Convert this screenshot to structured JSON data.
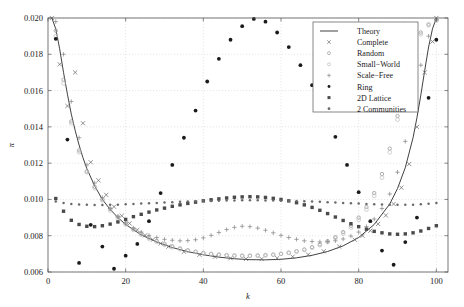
{
  "figure": {
    "background": "#ffffff",
    "frame_color": "#555555",
    "grid": true
  },
  "chart_data": {
    "type": "scatter",
    "title": "",
    "xlabel": "k",
    "ylabel": "π",
    "xlim": [
      0,
      103
    ],
    "ylim": [
      0.006,
      0.02
    ],
    "xticks": [
      0,
      20,
      40,
      60,
      80,
      100
    ],
    "xtick_labels": [
      "0",
      "20",
      "40",
      "60",
      "80",
      "100"
    ],
    "yticks": [
      0.006,
      0.008,
      0.01,
      0.012,
      0.014,
      0.016,
      0.018,
      0.02
    ],
    "ytick_labels": [
      "0.006",
      "0.008",
      "0.010",
      "0.012",
      "0.014",
      "0.016",
      "0.018",
      "0.020"
    ],
    "grid": true,
    "legend_position": "top-right",
    "series": [
      {
        "name": "Theory",
        "marker": "line",
        "color": "#2b2b2b",
        "x": [
          1,
          2,
          3,
          4,
          5,
          6,
          7,
          8,
          9,
          10,
          12,
          14,
          16,
          18,
          20,
          24,
          28,
          32,
          36,
          40,
          44,
          48,
          52,
          56,
          60,
          64,
          68,
          72,
          76,
          80,
          84,
          88,
          90,
          92,
          94,
          95,
          96,
          97,
          98,
          99,
          100
        ],
        "y": [
          0.02,
          0.0194,
          0.0183,
          0.017,
          0.0158,
          0.0147,
          0.0138,
          0.013,
          0.0123,
          0.0117,
          0.01075,
          0.01,
          0.00945,
          0.009,
          0.00862,
          0.00805,
          0.00765,
          0.00735,
          0.00712,
          0.00695,
          0.00682,
          0.00673,
          0.00668,
          0.00667,
          0.0067,
          0.00678,
          0.00692,
          0.00713,
          0.00744,
          0.0079,
          0.00862,
          0.00975,
          0.0106,
          0.01175,
          0.0134,
          0.0145,
          0.01575,
          0.0171,
          0.0184,
          0.0194,
          0.02
        ]
      },
      {
        "name": "Complete",
        "marker": "cross",
        "color": "#6e6e6e",
        "x": [
          1,
          3,
          5,
          7,
          9,
          11,
          13,
          15,
          17,
          19,
          21,
          23,
          25,
          27,
          29,
          31,
          35,
          39,
          43,
          47,
          51,
          55,
          59,
          63,
          67,
          71,
          75,
          79,
          81,
          83,
          85,
          87,
          89,
          91,
          93,
          95,
          97,
          99,
          100
        ],
        "y": [
          0.02,
          0.01745,
          0.01515,
          0.017,
          0.0142,
          0.01205,
          0.01105,
          0.01025,
          0.0096,
          0.0091,
          0.00868,
          0.00832,
          0.00802,
          0.00778,
          0.00757,
          0.0074,
          0.00712,
          0.00695,
          0.00684,
          0.00676,
          0.00672,
          0.00672,
          0.00676,
          0.00684,
          0.00696,
          0.00714,
          0.0074,
          0.00778,
          0.008,
          0.00828,
          0.00865,
          0.00912,
          0.00975,
          0.01065,
          0.01195,
          0.014,
          0.017,
          0.0187,
          0.02
        ]
      },
      {
        "name": "Random",
        "marker": "circle",
        "color": "#9a9a9a",
        "x": [
          2,
          4,
          6,
          8,
          10,
          12,
          14,
          16,
          18,
          20,
          22,
          24,
          26,
          28,
          30,
          32,
          34,
          36,
          38,
          40,
          42,
          44,
          46,
          48,
          50,
          52,
          54,
          56,
          58,
          60,
          62,
          64,
          66,
          68,
          70,
          72,
          74,
          76,
          78,
          80,
          82,
          84,
          86,
          88,
          90,
          92,
          94,
          96,
          98,
          100
        ],
        "y": [
          0.0193,
          0.0166,
          0.0143,
          0.0127,
          0.01155,
          0.0107,
          0.01,
          0.00948,
          0.00905,
          0.00868,
          0.00838,
          0.00812,
          0.0079,
          0.00772,
          0.00755,
          0.00742,
          0.0073,
          0.0072,
          0.00712,
          0.00705,
          0.00699,
          0.00695,
          0.00692,
          0.0069,
          0.00689,
          0.00689,
          0.0069,
          0.00692,
          0.00695,
          0.007,
          0.00706,
          0.00714,
          0.00724,
          0.00737,
          0.00752,
          0.0077,
          0.00792,
          0.0082,
          0.00855,
          0.009,
          0.00958,
          0.01035,
          0.0114,
          0.0128,
          0.0146,
          0.0165,
          0.0182,
          0.0192,
          0.01965,
          0.0199
        ]
      },
      {
        "name": "Small-World",
        "marker": "circle-open",
        "color": "#bdbdbd",
        "x": [
          2,
          4,
          6,
          8,
          10,
          12,
          14,
          16,
          18,
          20,
          22,
          24,
          26,
          28,
          30,
          32,
          34,
          36,
          38,
          40,
          42,
          44,
          46,
          48,
          50,
          52,
          54,
          56,
          58,
          60,
          62,
          64,
          66,
          68,
          70,
          72,
          74,
          76,
          78,
          80,
          82,
          84,
          86,
          88,
          90,
          92,
          94,
          96,
          98,
          100
        ],
        "y": [
          0.019,
          0.0164,
          0.0142,
          0.0126,
          0.0115,
          0.01062,
          0.00995,
          0.0094,
          0.00898,
          0.00862,
          0.00832,
          0.00806,
          0.00784,
          0.00766,
          0.0075,
          0.00737,
          0.00726,
          0.00717,
          0.0071,
          0.00704,
          0.00699,
          0.00696,
          0.00693,
          0.00691,
          0.0069,
          0.0069,
          0.00691,
          0.00693,
          0.00696,
          0.007,
          0.00706,
          0.00713,
          0.00722,
          0.00734,
          0.00748,
          0.00765,
          0.00786,
          0.00812,
          0.00845,
          0.00888,
          0.00944,
          0.0102,
          0.0112,
          0.0126,
          0.0144,
          0.0164,
          0.0181,
          0.0191,
          0.0196,
          0.01985
        ]
      },
      {
        "name": "Scale-Free",
        "marker": "plus",
        "color": "#8a8a8a",
        "x": [
          2,
          4,
          6,
          8,
          10,
          12,
          14,
          16,
          18,
          20,
          22,
          24,
          26,
          28,
          30,
          32,
          34,
          36,
          38,
          40,
          42,
          44,
          46,
          48,
          50,
          52,
          54,
          56,
          58,
          60,
          62,
          64,
          66,
          68,
          70,
          72,
          74,
          76,
          78,
          80,
          82,
          84,
          86,
          88,
          90,
          92,
          94,
          96,
          98,
          100
        ],
        "y": [
          0.0198,
          0.018,
          0.0154,
          0.0134,
          0.0119,
          0.0109,
          0.0101,
          0.0095,
          0.00905,
          0.0087,
          0.00842,
          0.0082,
          0.00802,
          0.0079,
          0.0078,
          0.00775,
          0.00772,
          0.00773,
          0.00778,
          0.00788,
          0.00802,
          0.00818,
          0.00834,
          0.00846,
          0.00852,
          0.0085,
          0.00842,
          0.0083,
          0.00816,
          0.00802,
          0.0079,
          0.0078,
          0.00772,
          0.00768,
          0.00766,
          0.00768,
          0.00772,
          0.00782,
          0.00798,
          0.0082,
          0.0085,
          0.00892,
          0.0095,
          0.0103,
          0.0115,
          0.0132,
          0.0153,
          0.0174,
          0.019,
          0.0199
        ]
      },
      {
        "name": "Ring",
        "marker": "dot",
        "color": "#1a1a1a",
        "x": [
          2,
          5,
          8,
          11,
          14,
          17,
          20,
          23,
          26,
          29,
          32,
          35,
          38,
          41,
          44,
          47,
          50,
          53,
          56,
          59,
          62,
          65,
          68,
          71,
          74,
          77,
          80,
          83,
          86,
          89,
          92,
          95,
          98,
          100
        ],
        "y": [
          0.01885,
          0.0133,
          0.0065,
          0.0086,
          0.0074,
          0.00618,
          0.0069,
          0.00755,
          0.0088,
          0.01035,
          0.0119,
          0.0134,
          0.0149,
          0.0165,
          0.01775,
          0.0188,
          0.01955,
          0.01995,
          0.0198,
          0.0192,
          0.0184,
          0.0174,
          0.0163,
          0.015,
          0.01345,
          0.0119,
          0.0104,
          0.0088,
          0.00718,
          0.0064,
          0.00765,
          0.009,
          0.0156,
          0.0188
        ]
      },
      {
        "name": "2D Lattice",
        "marker": "square",
        "color": "#4a4a4a",
        "x": [
          2,
          4,
          6,
          8,
          10,
          12,
          14,
          16,
          18,
          20,
          22,
          24,
          26,
          28,
          30,
          32,
          34,
          36,
          38,
          40,
          42,
          44,
          46,
          48,
          50,
          52,
          54,
          56,
          58,
          60,
          62,
          64,
          66,
          68,
          70,
          72,
          74,
          76,
          78,
          80,
          82,
          84,
          86,
          88,
          90,
          92,
          94,
          96,
          98,
          100
        ],
        "y": [
          0.01005,
          0.00935,
          0.00885,
          0.00862,
          0.00852,
          0.0085,
          0.00855,
          0.00864,
          0.00876,
          0.0089,
          0.00905,
          0.00918,
          0.0093,
          0.00942,
          0.00952,
          0.00962,
          0.0097,
          0.00978,
          0.00985,
          0.00992,
          0.00998,
          0.01003,
          0.01008,
          0.01012,
          0.01014,
          0.01015,
          0.01014,
          0.01011,
          0.01006,
          0.01,
          0.00992,
          0.00982,
          0.0097,
          0.00956,
          0.0094,
          0.00922,
          0.00903,
          0.00884,
          0.00866,
          0.0085,
          0.00836,
          0.00824,
          0.00816,
          0.0081,
          0.00808,
          0.0081,
          0.00816,
          0.00826,
          0.0084,
          0.00855
        ]
      },
      {
        "name": "2 Communities",
        "marker": "dot-small",
        "color": "#6a6a6a",
        "x": [
          2,
          4,
          6,
          8,
          10,
          12,
          14,
          16,
          18,
          20,
          22,
          24,
          26,
          28,
          30,
          32,
          34,
          36,
          38,
          40,
          42,
          44,
          46,
          48,
          50,
          52,
          54,
          56,
          58,
          60,
          62,
          64,
          66,
          68,
          70,
          72,
          74,
          76,
          78,
          80,
          82,
          84,
          86,
          88,
          90,
          92,
          94,
          96,
          98,
          100
        ],
        "y": [
          0.00988,
          0.0098,
          0.00975,
          0.00972,
          0.0097,
          0.00969,
          0.00969,
          0.0097,
          0.00971,
          0.00973,
          0.00975,
          0.00977,
          0.00979,
          0.00981,
          0.00983,
          0.00985,
          0.00987,
          0.00988,
          0.0099,
          0.00991,
          0.00992,
          0.00993,
          0.00994,
          0.00994,
          0.00995,
          0.00995,
          0.00995,
          0.00994,
          0.00994,
          0.00993,
          0.00992,
          0.00991,
          0.0099,
          0.00988,
          0.00987,
          0.00985,
          0.00983,
          0.00981,
          0.00979,
          0.00977,
          0.00975,
          0.00973,
          0.00972,
          0.00971,
          0.0097,
          0.0097,
          0.00971,
          0.00973,
          0.00976,
          0.0098
        ]
      }
    ]
  },
  "legend": {
    "entries": [
      {
        "label": "Theory"
      },
      {
        "label": "Complete"
      },
      {
        "label": "Random"
      },
      {
        "label": "Small−World"
      },
      {
        "label": "Scale−Free"
      },
      {
        "label": "Ring"
      },
      {
        "label": "2D Lattice"
      },
      {
        "label": "2 Communities"
      }
    ]
  }
}
